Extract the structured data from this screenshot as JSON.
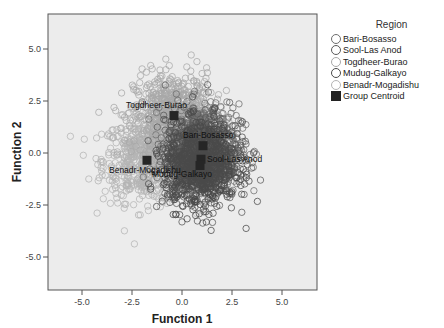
{
  "chart_data": {
    "type": "scatter",
    "title": "",
    "xlabel": "Function 1",
    "ylabel": "Function 2",
    "xlim": [
      -6.6,
      6.8
    ],
    "ylim": [
      -6.6,
      6.6
    ],
    "xticks": [
      -5.0,
      -2.5,
      0.0,
      2.5,
      5.0
    ],
    "yticks": [
      5.0,
      2.5,
      0.0,
      -2.5,
      -5.0
    ],
    "xtick_labels": [
      "-5.0",
      "-2.5",
      "0.0",
      "2.5",
      "5.0"
    ],
    "ytick_labels": [
      "5.0",
      "2.5",
      "0.0",
      "-2.5",
      "-5.0"
    ],
    "grid": false,
    "legend_position": "right",
    "legend_title": "Region",
    "series": [
      {
        "name": "Bari-Bosasso",
        "marker": "open-circle",
        "color": "#6e6e6e",
        "center": [
          1.05,
          0.35
        ],
        "spread": [
          0.9,
          1.0
        ]
      },
      {
        "name": "Sool-Las Anod",
        "marker": "open-circle",
        "color": "#5a5a5a",
        "center": [
          0.95,
          -0.3
        ],
        "spread": [
          0.9,
          1.0
        ]
      },
      {
        "name": "Togdheer-Burao",
        "marker": "open-circle",
        "color": "#a8a8a8",
        "center": [
          -0.4,
          1.8
        ],
        "spread": [
          1.0,
          1.0
        ]
      },
      {
        "name": "Mudug-Galkayo",
        "marker": "open-circle",
        "color": "#4a4a4a",
        "center": [
          0.9,
          -0.6
        ],
        "spread": [
          0.9,
          1.0
        ]
      },
      {
        "name": "Benadr-Mogadishu",
        "marker": "open-circle",
        "color": "#b4b4b4",
        "center": [
          -1.75,
          -0.35
        ],
        "spread": [
          1.1,
          1.0
        ]
      }
    ],
    "centroids": [
      {
        "label": "Togdheer-Burao",
        "x": -0.4,
        "y": 1.8,
        "label_dx": -48,
        "label_dy": -8
      },
      {
        "label": "Benadr-Mogadishu",
        "x": -1.75,
        "y": -0.35,
        "label_dx": -38,
        "label_dy": 13
      },
      {
        "label": "Bari-Bosasso",
        "x": 1.05,
        "y": 0.35,
        "label_dx": -20,
        "label_dy": -8
      },
      {
        "label": "Sool-Las Anod",
        "x": 0.95,
        "y": -0.3,
        "label_dx": 6,
        "label_dy": 3
      },
      {
        "label": "Mudug-Galkayo",
        "x": 0.9,
        "y": -0.6,
        "label_dx": -48,
        "label_dy": 12
      }
    ],
    "centroid_legend_label": "Group Centroid"
  },
  "colors": {
    "plot_background": "#ececec",
    "frame": "#555555",
    "centroid": "#262626"
  }
}
